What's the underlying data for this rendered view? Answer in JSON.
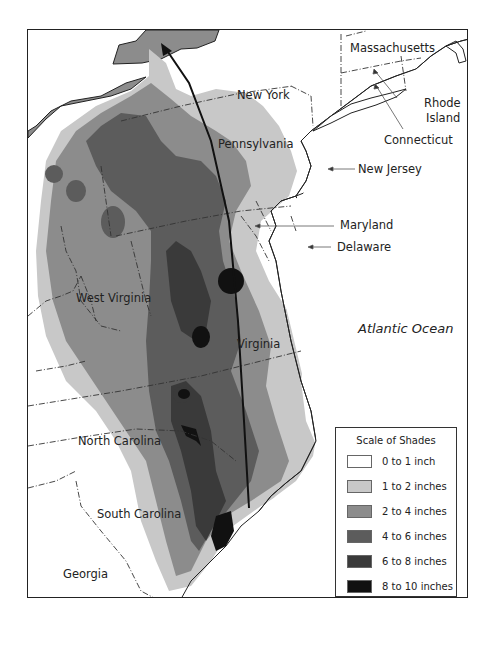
{
  "map": {
    "states": [
      {
        "name": "New York"
      },
      {
        "name": "Massachusetts"
      },
      {
        "name": "Rhode Island",
        "lines": [
          "Rhode",
          "Island"
        ]
      },
      {
        "name": "Connecticut"
      },
      {
        "name": "Pennsylvania"
      },
      {
        "name": "New Jersey"
      },
      {
        "name": "Maryland"
      },
      {
        "name": "Delaware"
      },
      {
        "name": "West Virginia"
      },
      {
        "name": "Virginia"
      },
      {
        "name": "North Carolina"
      },
      {
        "name": "South Carolina"
      },
      {
        "name": "Georgia"
      }
    ],
    "water": {
      "ocean": "Atlantic Ocean"
    },
    "storm_track": {
      "direction": "north",
      "description": "arrow from South Carolina coast to New York"
    }
  },
  "legend": {
    "title": "Scale of Shades",
    "items": [
      {
        "label": "0 to 1 inch",
        "color": "#ffffff"
      },
      {
        "label": "1 to 2 inches",
        "color": "#c8c8c8"
      },
      {
        "label": "2 to 4 inches",
        "color": "#8c8c8c"
      },
      {
        "label": "4 to 6 inches",
        "color": "#5c5c5c"
      },
      {
        "label": "6 to 8 inches",
        "color": "#3a3a3a"
      },
      {
        "label": "8 to 10 inches",
        "color": "#111111"
      }
    ]
  }
}
